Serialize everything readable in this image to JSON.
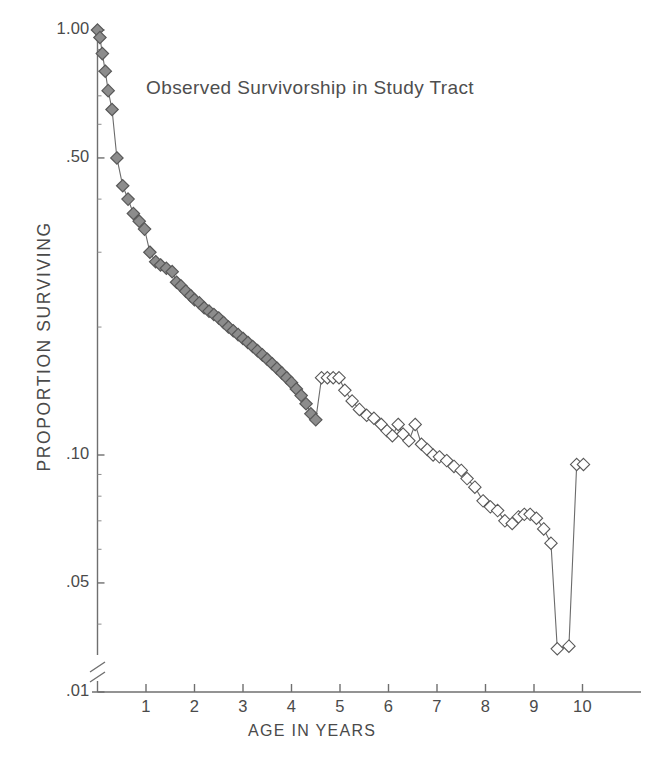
{
  "chart_data": {
    "type": "line",
    "title": "Observed Survivorship in Study Tract",
    "xlabel": "AGE IN YEARS",
    "ylabel": "PROPORTION SURVIVING",
    "yscale": "log",
    "ylim": [
      0.01,
      1.0
    ],
    "xlim": [
      0,
      11.2
    ],
    "grid": false,
    "legend": null,
    "axis_break": "y-axis broken between .05 and .01",
    "y_tick_labels": [
      "1.00",
      ".50",
      ".10",
      ".05",
      ".01"
    ],
    "y_tick_values": [
      1.0,
      0.5,
      0.1,
      0.05,
      0.01
    ],
    "x_tick_labels": [
      "1",
      "2",
      "3",
      "4",
      "5",
      "6",
      "7",
      "8",
      "9",
      "10"
    ],
    "x_tick_values": [
      1,
      2,
      3,
      4,
      5,
      6,
      7,
      8,
      9,
      10
    ],
    "marker_filled_color": "#8c8c8c",
    "marker_open_color": "#ffffff",
    "marker_edge_color": "#585858",
    "line_color": "#6b6b6b",
    "series": [
      {
        "name": "Observed survivorship",
        "marker": "diamond",
        "x": [
          0.0,
          0.05,
          0.1,
          0.16,
          0.22,
          0.3,
          0.4,
          0.52,
          0.63,
          0.74,
          0.86,
          0.97,
          1.08,
          1.2,
          1.3,
          1.42,
          1.54,
          1.63,
          1.72,
          1.82,
          1.92,
          2.0,
          2.1,
          2.2,
          2.3,
          2.4,
          2.5,
          2.6,
          2.7,
          2.8,
          2.9,
          3.0,
          3.1,
          3.2,
          3.3,
          3.4,
          3.5,
          3.6,
          3.7,
          3.8,
          3.9,
          4.0,
          4.1,
          4.2,
          4.3,
          4.4,
          4.5,
          4.62,
          4.74,
          4.86,
          4.98,
          5.1,
          5.25,
          5.4,
          5.55,
          5.7,
          5.85,
          5.97,
          6.08,
          6.2,
          6.3,
          6.42,
          6.55,
          6.68,
          6.8,
          6.92,
          7.05,
          7.2,
          7.35,
          7.5,
          7.62,
          7.78,
          7.95,
          8.1,
          8.25,
          8.4,
          8.55,
          8.68,
          8.8,
          8.92,
          9.05,
          9.2,
          9.35,
          9.48,
          9.72,
          9.88,
          10.02
        ],
        "y": [
          1.0,
          0.96,
          0.88,
          0.8,
          0.72,
          0.65,
          0.5,
          0.43,
          0.4,
          0.37,
          0.355,
          0.34,
          0.3,
          0.285,
          0.28,
          0.275,
          0.27,
          0.255,
          0.25,
          0.243,
          0.237,
          0.232,
          0.228,
          0.222,
          0.218,
          0.214,
          0.21,
          0.205,
          0.2,
          0.196,
          0.192,
          0.188,
          0.184,
          0.18,
          0.176,
          0.172,
          0.168,
          0.164,
          0.16,
          0.156,
          0.152,
          0.148,
          0.143,
          0.138,
          0.132,
          0.125,
          0.121,
          0.152,
          0.152,
          0.152,
          0.152,
          0.142,
          0.134,
          0.128,
          0.124,
          0.122,
          0.118,
          0.114,
          0.111,
          0.118,
          0.112,
          0.108,
          0.118,
          0.106,
          0.103,
          0.1,
          0.099,
          0.097,
          0.094,
          0.092,
          0.088,
          0.084,
          0.078,
          0.0755,
          0.074,
          0.07,
          0.069,
          0.0715,
          0.0725,
          0.0725,
          0.071,
          0.067,
          0.062,
          0.035,
          0.0355,
          0.095,
          0.095
        ],
        "filled_through_index": 46,
        "notes": "Markers are filled gray diamonds for ages 0 through about 4.5 years, and open (unfilled) diamonds thereafter."
      }
    ]
  },
  "axes": {
    "y_ticks": [
      {
        "label": "1.00",
        "value": 1.0
      },
      {
        "label": ".50",
        "value": 0.5
      },
      {
        "label": ".10",
        "value": 0.1
      },
      {
        "label": ".05",
        "value": 0.05
      },
      {
        "label": ".01",
        "value": 0.01
      }
    ],
    "x_ticks": [
      {
        "label": "1",
        "value": 1
      },
      {
        "label": "2",
        "value": 2
      },
      {
        "label": "3",
        "value": 3
      },
      {
        "label": "4",
        "value": 4
      },
      {
        "label": "5",
        "value": 5
      },
      {
        "label": "6",
        "value": 6
      },
      {
        "label": "7",
        "value": 7
      },
      {
        "label": "8",
        "value": 8
      },
      {
        "label": "9",
        "value": 9
      },
      {
        "label": "10",
        "value": 10
      }
    ]
  }
}
